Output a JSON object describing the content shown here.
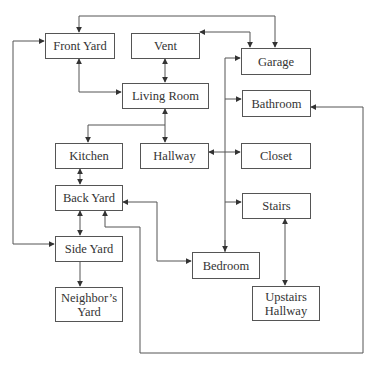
{
  "diagram": {
    "type": "flowchart",
    "line_color": "#555555",
    "nodes": [
      {
        "id": "front_yard",
        "label": "Front Yard"
      },
      {
        "id": "vent",
        "label": "Vent"
      },
      {
        "id": "garage",
        "label": "Garage"
      },
      {
        "id": "living_room",
        "label": "Living Room"
      },
      {
        "id": "bathroom",
        "label": "Bathroom"
      },
      {
        "id": "kitchen",
        "label": "Kitchen"
      },
      {
        "id": "hallway",
        "label": "Hallway"
      },
      {
        "id": "closet",
        "label": "Closet"
      },
      {
        "id": "back_yard",
        "label": "Back Yard"
      },
      {
        "id": "stairs",
        "label": "Stairs"
      },
      {
        "id": "side_yard",
        "label": "Side Yard"
      },
      {
        "id": "bedroom",
        "label": "Bedroom"
      },
      {
        "id": "neighbors_yard",
        "label": "Neighbor’s Yard"
      },
      {
        "id": "upstairs_hallway",
        "label": "Upstairs Hallway"
      }
    ],
    "edges": [
      {
        "from": "garage",
        "to": "front_yard",
        "direction": "both"
      },
      {
        "from": "vent",
        "to": "garage",
        "direction": "both"
      },
      {
        "from": "vent",
        "to": "living_room",
        "direction": "both"
      },
      {
        "from": "front_yard",
        "to": "living_room",
        "direction": "both"
      },
      {
        "from": "side_yard",
        "to": "front_yard",
        "direction": "both"
      },
      {
        "from": "living_room",
        "to": "kitchen",
        "direction": "both"
      },
      {
        "from": "living_room",
        "to": "hallway",
        "direction": "both"
      },
      {
        "from": "hallway",
        "to": "closet",
        "direction": "both"
      },
      {
        "from": "hallway",
        "to": "garage",
        "direction": "forward"
      },
      {
        "from": "hallway",
        "to": "bathroom",
        "direction": "forward"
      },
      {
        "from": "hallway",
        "to": "stairs",
        "direction": "forward"
      },
      {
        "from": "hallway",
        "to": "bedroom",
        "direction": "forward"
      },
      {
        "from": "kitchen",
        "to": "back_yard",
        "direction": "both"
      },
      {
        "from": "back_yard",
        "to": "side_yard",
        "direction": "both"
      },
      {
        "from": "back_yard",
        "to": "bedroom",
        "direction": "both"
      },
      {
        "from": "back_yard",
        "to": "bathroom",
        "direction": "both"
      },
      {
        "from": "side_yard",
        "to": "neighbors_yard",
        "direction": "forward"
      },
      {
        "from": "stairs",
        "to": "upstairs_hallway",
        "direction": "both"
      }
    ]
  },
  "labels": {
    "front_yard": "Front Yard",
    "vent": "Vent",
    "garage": "Garage",
    "living_room": "Living Room",
    "bathroom": "Bathroom",
    "kitchen": "Kitchen",
    "hallway": "Hallway",
    "closet": "Closet",
    "back_yard": "Back Yard",
    "stairs": "Stairs",
    "side_yard": "Side Yard",
    "bedroom": "Bedroom",
    "neighbors_yard": "Neighbor’s Yard",
    "upstairs_hallway": "Upstairs Hallway"
  }
}
